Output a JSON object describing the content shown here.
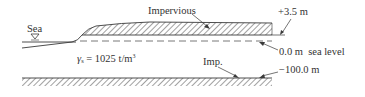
{
  "diagram": {
    "type": "cross-section",
    "labels": {
      "sea": "Sea",
      "impervious_top": "Impervious",
      "elevation_top": "+3.5 m",
      "sea_level": "0.0 m  sea level",
      "density_symbol": "γ",
      "density_subscript": "s",
      "density_value": " = 1025 t/m",
      "density_exponent": "3",
      "impervious_bottom": "Imp.",
      "elevation_bottom": "−100.0 m"
    },
    "symbols": {
      "water_surface": "inverted-triangle"
    },
    "colors": {
      "line": "#3a3a3a",
      "text": "#333333",
      "background": "#ffffff"
    }
  }
}
